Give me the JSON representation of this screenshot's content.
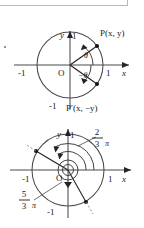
{
  "figures": [
    {
      "id": "unit-circle-reflection",
      "axis": {
        "x_label": "x",
        "y_label": "y",
        "origin_label": "O",
        "x_pos_tick": "1",
        "x_neg_tick": "-1",
        "y_pos_tick": "1",
        "y_neg_tick": "-1"
      },
      "points": [
        {
          "name": "P",
          "label": "P(x,  y)"
        },
        {
          "name": "P-prime",
          "label": "P′(x,  −y)"
        }
      ],
      "angles": [
        {
          "name": "theta",
          "label": "θ"
        },
        {
          "name": "negative-theta",
          "label": "−θ"
        }
      ]
    },
    {
      "id": "unit-circle-angles",
      "axis": {
        "x_label": "x",
        "y_label": "y",
        "origin_label": "O",
        "x_pos_tick": "1",
        "x_neg_tick": "-1",
        "y_pos_tick": "1",
        "y_neg_tick": "-1"
      },
      "angle_labels": [
        {
          "name": "two-thirds-pi",
          "numerator": "2",
          "denominator": "3",
          "symbol": "π"
        },
        {
          "name": "five-thirds-pi",
          "numerator": "5",
          "denominator": "3",
          "symbol": "π"
        }
      ]
    }
  ],
  "colors": {
    "ink": "#1b1b1b",
    "axis": "#4a4a4c",
    "dashed": "#8d8d90",
    "box_border": "#b9b9bb",
    "background": "#ffffff"
  }
}
